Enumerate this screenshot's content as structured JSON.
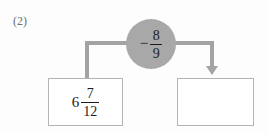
{
  "problem": {
    "label": "(2)",
    "type": "fraction-subtraction-flow"
  },
  "operator": {
    "sign": "−",
    "fraction": {
      "numerator": "8",
      "denominator": "9"
    },
    "full_text": "− 8/9",
    "shape": "circle",
    "fill_color": "#a8a8a8"
  },
  "input_box": {
    "whole": "6",
    "fraction": {
      "numerator": "7",
      "denominator": "12"
    },
    "full_text": "6 7/12"
  },
  "output_box": {
    "value": "",
    "placeholder": ""
  },
  "connector": {
    "color": "#a3a3a3",
    "arrow_direction": "down"
  }
}
